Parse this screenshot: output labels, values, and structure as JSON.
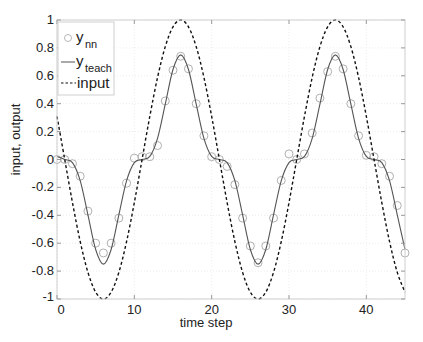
{
  "chart_data": {
    "type": "line",
    "title": "",
    "xlabel": "time step",
    "ylabel": "input, output",
    "xlim": [
      0,
      45
    ],
    "ylim": [
      -1,
      1
    ],
    "grid": true,
    "legend_position": "upper-left",
    "xticks": [
      0,
      10,
      20,
      30,
      40
    ],
    "yticks": [
      -1,
      -0.8,
      -0.6,
      -0.4,
      -0.2,
      0,
      0.2,
      0.4,
      0.6,
      0.8,
      1
    ],
    "ytick_labels": [
      "-1",
      "-0.8",
      "-0.6",
      "-0.4",
      "-0.2",
      "0",
      "0.2",
      "0.4",
      "0.6",
      "0.8",
      "1"
    ],
    "xtick_labels": [
      "0",
      "10",
      "20",
      "30",
      "40"
    ],
    "x": [
      0,
      1,
      2,
      3,
      4,
      5,
      6,
      7,
      8,
      9,
      10,
      11,
      12,
      13,
      14,
      15,
      16,
      17,
      18,
      19,
      20,
      21,
      22,
      23,
      24,
      25,
      26,
      27,
      28,
      29,
      30,
      31,
      32,
      33,
      34,
      35,
      36,
      37,
      38,
      39,
      40,
      41,
      42,
      43,
      44,
      45
    ],
    "series": [
      {
        "name": "y_nn",
        "legend_label": "y",
        "legend_sub": "nn",
        "style": "circles",
        "color": "#b0b0b0",
        "values": [
          0.0,
          0.0,
          -0.03,
          -0.12,
          -0.37,
          -0.6,
          -0.67,
          -0.6,
          -0.42,
          -0.17,
          0.01,
          0.02,
          0.02,
          0.1,
          0.42,
          0.64,
          0.74,
          0.65,
          0.4,
          0.17,
          0.02,
          0.0,
          -0.05,
          -0.18,
          -0.42,
          -0.62,
          -0.74,
          -0.62,
          -0.42,
          -0.15,
          0.04,
          0.0,
          0.04,
          0.19,
          0.44,
          0.63,
          0.74,
          0.65,
          0.4,
          0.17,
          0.03,
          0.02,
          -0.03,
          -0.12,
          -0.33,
          -0.67
        ]
      },
      {
        "name": "y_teach",
        "legend_label": "y",
        "legend_sub": "teach",
        "style": "solid",
        "color": "#555555",
        "values": [
          0.022,
          0.0,
          -0.022,
          -0.152,
          -0.397,
          -0.645,
          -0.75,
          -0.645,
          -0.397,
          -0.152,
          -0.022,
          0.0,
          0.022,
          0.152,
          0.397,
          0.645,
          0.75,
          0.645,
          0.397,
          0.152,
          0.022,
          0.0,
          -0.022,
          -0.152,
          -0.397,
          -0.645,
          -0.75,
          -0.645,
          -0.397,
          -0.152,
          -0.022,
          0.0,
          0.022,
          0.152,
          0.397,
          0.645,
          0.75,
          0.645,
          0.397,
          0.152,
          0.022,
          0.0,
          -0.022,
          -0.152,
          -0.397,
          -0.645
        ]
      },
      {
        "name": "input",
        "legend_label": "input",
        "legend_sub": "",
        "style": "dashed",
        "color": "#111111",
        "values": [
          0.309,
          0.0,
          -0.309,
          -0.588,
          -0.809,
          -0.951,
          -1.0,
          -0.951,
          -0.809,
          -0.588,
          -0.309,
          0.0,
          0.309,
          0.588,
          0.809,
          0.951,
          1.0,
          0.951,
          0.809,
          0.588,
          0.309,
          0.0,
          -0.309,
          -0.588,
          -0.809,
          -0.951,
          -1.0,
          -0.951,
          -0.809,
          -0.588,
          -0.309,
          0.0,
          0.309,
          0.588,
          0.809,
          0.951,
          1.0,
          0.951,
          0.809,
          0.588,
          0.309,
          0.0,
          -0.309,
          -0.588,
          -0.809,
          -0.951
        ]
      }
    ]
  },
  "layout": {
    "plot_left": 57,
    "plot_top": 20,
    "plot_right": 405,
    "plot_bottom": 299,
    "frame_color": "#cfcfcf",
    "grid_color": "#ececec"
  }
}
